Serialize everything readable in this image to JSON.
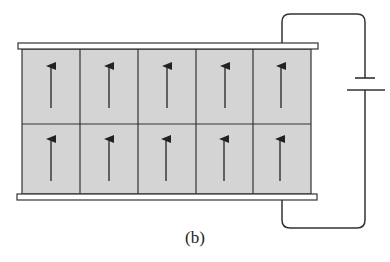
{
  "figure": {
    "caption": "(b)",
    "grid": {
      "rows": 2,
      "cols": 5,
      "arrow_direction": "up"
    },
    "colors": {
      "cell_fill": "#d4d4d4",
      "line": "#333333",
      "plate_fill": "#ffffff"
    },
    "battery": {
      "short_plate": "top",
      "long_plate": "bottom"
    }
  }
}
